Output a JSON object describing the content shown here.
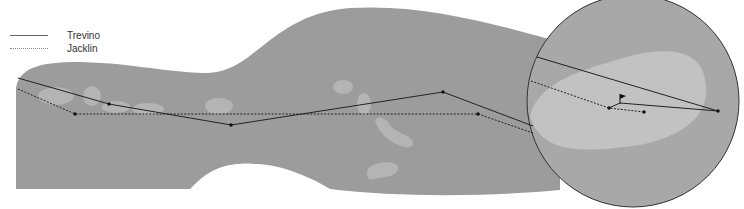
{
  "legend": {
    "items": [
      {
        "label": "Trevino",
        "style": "solid"
      },
      {
        "label": "Jacklin",
        "style": "dotted"
      }
    ]
  },
  "colors": {
    "fairway": "#9c9c9c",
    "hazard": "#b4b4b4",
    "green_circle": "#a8a8a8",
    "green_surface": "#c2c2c2",
    "line": "#222222",
    "background": "#ffffff"
  },
  "paths": {
    "trevino": [
      [
        18,
        78
      ],
      [
        109,
        104
      ],
      [
        231,
        125
      ],
      [
        443,
        92
      ],
      [
        533,
        126
      ]
    ],
    "jacklin": [
      [
        18,
        89
      ],
      [
        75,
        114
      ],
      [
        478,
        114
      ],
      [
        533,
        133
      ]
    ],
    "trevino_green": [
      [
        537,
        57
      ],
      [
        718,
        111
      ],
      [
        620,
        103
      ],
      [
        609,
        108
      ]
    ],
    "jacklin_green": [
      [
        531,
        81
      ],
      [
        609,
        108
      ],
      [
        644,
        112
      ]
    ]
  }
}
